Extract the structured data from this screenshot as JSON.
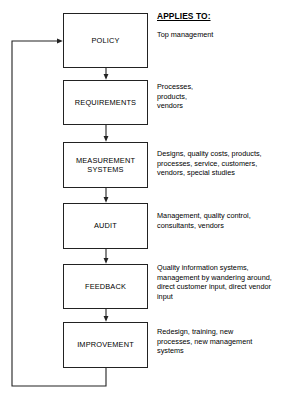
{
  "diagram": {
    "title_column": {
      "header": "APPLIES TO:"
    },
    "nodes": [
      {
        "id": "policy",
        "label": "POLICY",
        "applies_to": "Top management",
        "box": {
          "top": 13,
          "height": 55
        },
        "desc_top": 30
      },
      {
        "id": "requirements",
        "label": "REQUIREMENTS",
        "applies_to": "Processes,\nproducts,\nvendors",
        "box": {
          "top": 80,
          "height": 45
        },
        "desc_top": 82
      },
      {
        "id": "measurement-systems",
        "label": "MEASUREMENT\nSYSTEMS",
        "applies_to": "Designs, quality costs, products,\nprocesses, service, customers,\nvendors, special studies",
        "box": {
          "top": 142,
          "height": 46
        },
        "desc_top": 149
      },
      {
        "id": "audit",
        "label": "AUDIT",
        "applies_to": "Management, quality control,\nconsultants, vendors",
        "box": {
          "top": 203,
          "height": 46
        },
        "desc_top": 211
      },
      {
        "id": "feedback",
        "label": "FEEDBACK",
        "applies_to": "Quality information systems,\nmanagement by wandering around,\ndirect customer input, direct vendor\ninput",
        "box": {
          "top": 264,
          "height": 45
        },
        "desc_top": 263
      },
      {
        "id": "improvement",
        "label": "IMPROVEMENT",
        "applies_to": "Redesign, training, new\nprocesses, new management\nsystems",
        "box": {
          "top": 322,
          "height": 46
        },
        "desc_top": 327
      }
    ],
    "colors": {
      "line": "#222222",
      "text": "#000000",
      "background": "#ffffff"
    }
  }
}
